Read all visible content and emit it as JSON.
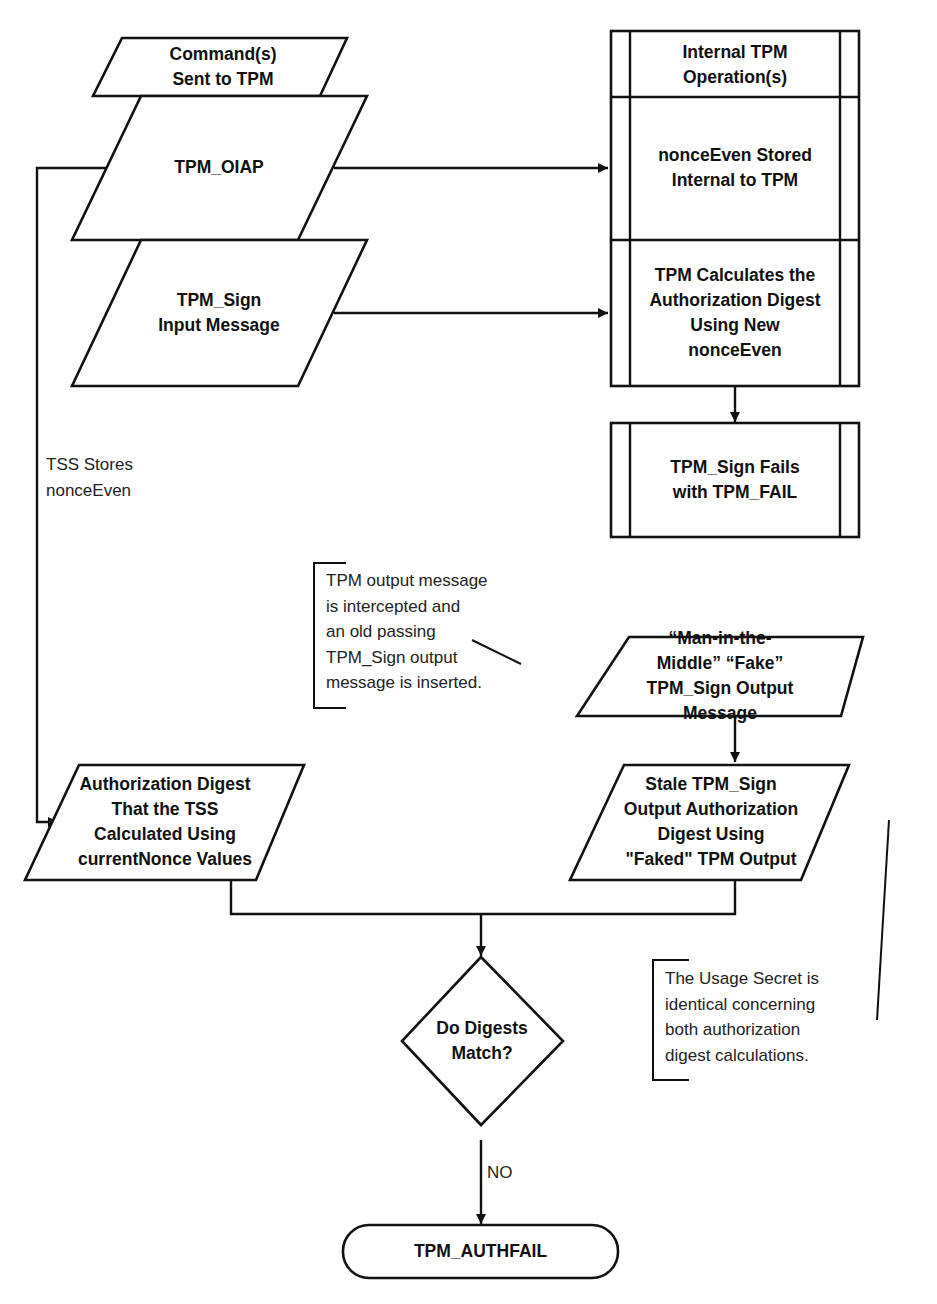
{
  "diagram": {
    "type": "flowchart",
    "colors": {
      "stroke": "#111111",
      "background": "#ffffff",
      "text": "#111111"
    },
    "nodes": {
      "commands_header": {
        "shape": "parallelogram",
        "label": "Command(s)\nSent to TPM"
      },
      "tpm_oiap": {
        "shape": "parallelogram",
        "label": "TPM_OIAP"
      },
      "tpm_sign_input": {
        "shape": "parallelogram",
        "label": "TPM_Sign\nInput Message"
      },
      "internal_header": {
        "shape": "predefined-process",
        "label": "Internal TPM\nOperation(s)"
      },
      "nonce_stored": {
        "shape": "predefined-process",
        "label": "nonceEven Stored\nInternal to TPM"
      },
      "tpm_calculates": {
        "shape": "predefined-process",
        "label": "TPM Calculates the\nAuthorization Digest\nUsing New\nnonceEven"
      },
      "sign_fails": {
        "shape": "predefined-process",
        "label": "TPM_Sign Fails\nwith TPM_FAIL"
      },
      "mitm_output": {
        "shape": "parallelogram",
        "label": "“Man-in-the-\nMiddle” “Fake”\nTPM_Sign Output\nMessage"
      },
      "stale_digest": {
        "shape": "parallelogram",
        "label": "Stale TPM_Sign\nOutput Authorization\nDigest Using\n\"Faked\" TPM Output"
      },
      "tss_digest": {
        "shape": "parallelogram",
        "label": "Authorization Digest\nThat the TSS\nCalculated Using\ncurrentNonce Values"
      },
      "digests_match": {
        "shape": "diamond",
        "label": "Do Digests\nMatch?"
      },
      "authfail": {
        "shape": "terminator",
        "label": "TPM_AUTHFAIL"
      }
    },
    "edge_labels": {
      "tss_stores": "TSS Stores\nnonceEven",
      "no": "NO"
    },
    "annotations": {
      "intercepted": "TPM output message\nis intercepted and\nan old passing\nTPM_Sign output\nmessage is inserted.",
      "usage_secret": "The Usage Secret is\nidentical concerning\nboth authorization\ndigest calculations."
    },
    "edges": [
      {
        "from": "tpm_oiap",
        "to": "nonce_stored"
      },
      {
        "from": "tpm_sign_input",
        "to": "tpm_calculates"
      },
      {
        "from": "tpm_calculates",
        "to": "sign_fails"
      },
      {
        "from": "tpm_oiap",
        "to": "tss_digest",
        "label": "TSS Stores\nnonceEven"
      },
      {
        "from": "mitm_output",
        "to": "stale_digest"
      },
      {
        "from": "tss_digest",
        "to": "digests_match"
      },
      {
        "from": "stale_digest",
        "to": "digests_match"
      },
      {
        "from": "digests_match",
        "to": "authfail",
        "label": "NO"
      }
    ]
  }
}
